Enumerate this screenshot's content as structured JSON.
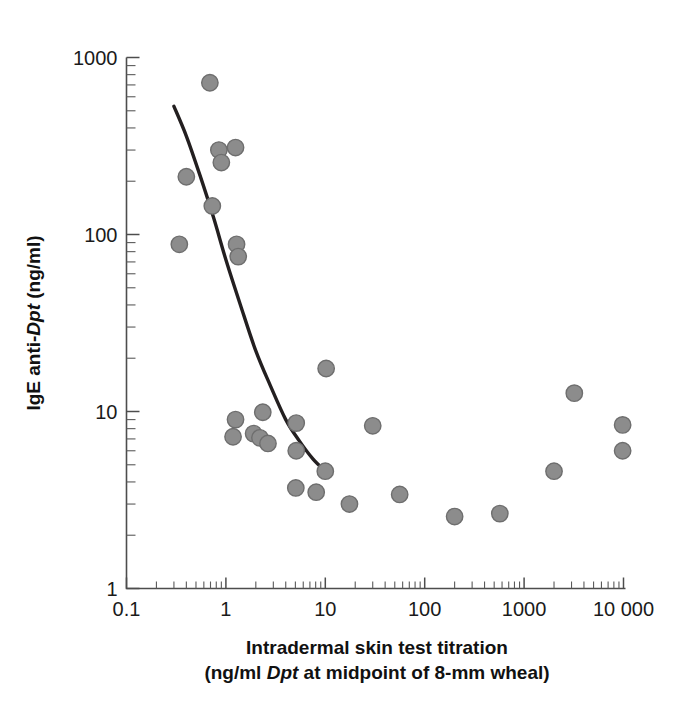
{
  "figure": {
    "background_color": "#ffffff",
    "marker_color": "#8c8c8c",
    "marker_edge_color": "#6e6e6e",
    "curve_color": "#231f20",
    "axis_color": "#4d4d4d"
  },
  "axes": {
    "x_title_line1": "Intradermal skin test titration",
    "x_title_line2_pre": "(ng/ml ",
    "x_title_line2_italic": "Dpt",
    "x_title_line2_post": " at midpoint of 8-mm wheal)",
    "y_title_pre": "IgE anti-",
    "y_title_italic": "Dpt",
    "y_title_post": " (ng/ml)"
  },
  "chart_data": {
    "type": "scatter",
    "title": "",
    "xlabel": "Intradermal skin test titration (ng/ml Dpt at midpoint of 8-mm wheal)",
    "ylabel": "IgE anti-Dpt (ng/ml)",
    "xscale": "log",
    "yscale": "log",
    "xlim": [
      0.1,
      10000
    ],
    "ylim": [
      1,
      1000
    ],
    "grid": false,
    "legend": "none",
    "xticks": [
      0.1,
      1,
      10,
      100,
      1000,
      10000
    ],
    "xticklabels": [
      "0.1",
      "1",
      "10",
      "100",
      "1000",
      "10 000"
    ],
    "yticks": [
      1,
      10,
      100,
      1000
    ],
    "yticklabels": [
      "1",
      "10",
      "100",
      "1000"
    ],
    "minor_ticks": true,
    "series": [
      {
        "name": "Subjects",
        "marker": "circle",
        "points": [
          [
            0.69,
            720
          ],
          [
            0.4,
            212
          ],
          [
            0.85,
            300
          ],
          [
            1.25,
            310
          ],
          [
            0.9,
            255
          ],
          [
            0.73,
            145
          ],
          [
            0.34,
            88
          ],
          [
            1.28,
            88
          ],
          [
            1.33,
            75
          ],
          [
            1.25,
            9.0
          ],
          [
            2.35,
            9.9
          ],
          [
            1.18,
            7.2
          ],
          [
            1.9,
            7.5
          ],
          [
            2.2,
            7.1
          ],
          [
            2.65,
            6.6
          ],
          [
            5.1,
            8.6
          ],
          [
            5.1,
            6.0
          ],
          [
            5.05,
            3.7
          ],
          [
            8.1,
            3.5
          ],
          [
            10.0,
            4.6
          ],
          [
            10.2,
            17.5
          ],
          [
            17.5,
            3.0
          ],
          [
            30.0,
            8.3
          ],
          [
            56.0,
            3.4
          ],
          [
            200.0,
            2.55
          ],
          [
            570.0,
            2.65
          ],
          [
            2000.0,
            4.6
          ],
          [
            3200.0,
            12.7
          ],
          [
            9800.0,
            8.4
          ],
          [
            9800.0,
            6.0
          ]
        ]
      }
    ],
    "fit_curve": {
      "name": "fitted trend line",
      "points": [
        [
          0.3,
          530
        ],
        [
          0.4,
          360
        ],
        [
          0.55,
          215
        ],
        [
          0.75,
          125
        ],
        [
          1.0,
          72
        ],
        [
          1.4,
          40
        ],
        [
          2.0,
          22
        ],
        [
          2.8,
          14.0
        ],
        [
          4.0,
          9.0
        ],
        [
          5.5,
          6.8
        ],
        [
          7.5,
          5.4
        ],
        [
          10.0,
          4.6
        ]
      ]
    }
  }
}
